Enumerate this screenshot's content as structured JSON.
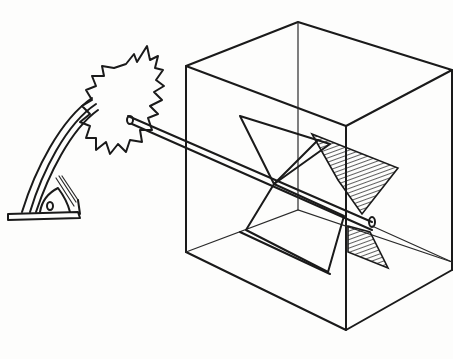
{
  "figure": {
    "description": "Hand-drawn sketch of a paddle-wheel mechanism: a serrated disc mounted on a curved stand drives a shaft passing into a wireframe box containing crossed paddles",
    "style": "pen-and-ink line drawing, black on white",
    "components": [
      {
        "id": "stand",
        "label": "curved support stand with base plate"
      },
      {
        "id": "serrated-disc",
        "label": "toothed/serrated wheel"
      },
      {
        "id": "shaft",
        "label": "long axle rod"
      },
      {
        "id": "box",
        "label": "transparent cube frame"
      },
      {
        "id": "paddles",
        "label": "crossed paddle blades inside box, partially hatched"
      }
    ],
    "colors": {
      "ink": "#1a1a1a",
      "paper": "#fdfdfc"
    }
  }
}
